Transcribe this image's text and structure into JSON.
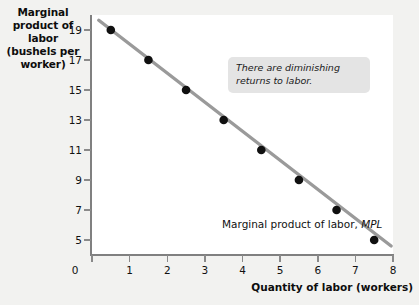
{
  "chart_data": {
    "type": "scatter",
    "title": "",
    "xlabel": "Quantity of labor (workers)",
    "ylabel": "Marginal product of labor (bushels per worker)",
    "xlim": [
      0,
      8
    ],
    "ylim": [
      4,
      20
    ],
    "grid": false,
    "legend_position": "inline-right",
    "x": [
      0.5,
      1.5,
      2.5,
      3.5,
      4.5,
      5.5,
      6.5,
      7.5
    ],
    "values": [
      19,
      17,
      15,
      13,
      11,
      9,
      7,
      5
    ],
    "series": [
      {
        "name": "Marginal product of labor, MPL",
        "x": [
          0.5,
          1.5,
          2.5,
          3.5,
          4.5,
          5.5,
          6.5,
          7.5
        ],
        "values": [
          19,
          17,
          15,
          13,
          11,
          9,
          7,
          5
        ],
        "line_color": "#9a9a9a",
        "marker_color": "#101010"
      }
    ],
    "line_endpoints": {
      "x": [
        0.18,
        7.95
      ],
      "y": [
        19.65,
        4.6
      ]
    },
    "xticks": [
      0,
      1,
      2,
      3,
      4,
      5,
      6,
      7,
      8
    ],
    "xtick_labels": [
      "0",
      "1",
      "2",
      "3",
      "4",
      "5",
      "6",
      "7",
      "8"
    ],
    "yticks": [
      5,
      7,
      9,
      11,
      13,
      15,
      17,
      19
    ],
    "ytick_labels": [
      "5",
      "7",
      "9",
      "11",
      "13",
      "15",
      "17",
      "19"
    ],
    "origin_label": "0",
    "annotations": [
      {
        "name": "diminishing-returns-callout",
        "text": "There are diminishing returns to labor.",
        "style": "italic",
        "background": "#e4e4e4"
      }
    ],
    "series_label": {
      "prefix": "Marginal product of labor, ",
      "symbol": "MPL"
    }
  },
  "axis_titles": {
    "y": "Marginal product of labor (bushels per worker)",
    "y_lines": [
      "Marginal",
      "product of labor",
      "(bushels per",
      "worker)"
    ],
    "x": "Quantity of labor (workers)"
  },
  "colors": {
    "page_background": "#f2f2f0",
    "plot_background": "#ffffff",
    "axis": "#808080",
    "line": "#9a9a9a",
    "marker": "#101010",
    "callout_background": "#e4e4e4",
    "text": "#111111"
  }
}
